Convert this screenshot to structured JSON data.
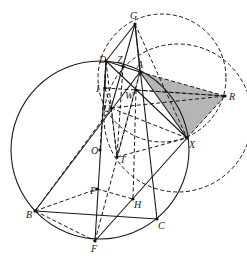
{
  "figure": {
    "type": "geometry-diagram",
    "points": [
      {
        "name": "G",
        "x": 135,
        "y": 24,
        "lx": 130,
        "ly": 19
      },
      {
        "name": "D",
        "x": 106,
        "y": 61,
        "lx": 99,
        "ly": 63
      },
      {
        "name": "Z",
        "x": 123,
        "y": 66,
        "lx": 117,
        "ly": 63
      },
      {
        "name": "A",
        "x": 140,
        "y": 72,
        "lx": 137,
        "ly": 68
      },
      {
        "name": "I",
        "x": 105,
        "y": 88,
        "lx": 96,
        "ly": 92
      },
      {
        "name": "W",
        "x": 136,
        "y": 90,
        "lx": 125,
        "ly": 99
      },
      {
        "name": "R",
        "x": 225,
        "y": 96,
        "lx": 229,
        "ly": 100
      },
      {
        "name": "U",
        "x": 111,
        "y": 108,
        "lx": 103,
        "ly": 112
      },
      {
        "name": "X",
        "x": 187,
        "y": 138,
        "lx": 189,
        "ly": 148
      },
      {
        "name": "O",
        "x": 100,
        "y": 150,
        "lx": 91,
        "ly": 154
      },
      {
        "name": "T",
        "x": 117,
        "y": 157,
        "lx": 120,
        "ly": 163
      },
      {
        "name": "P",
        "x": 97,
        "y": 189,
        "lx": 90,
        "ly": 194
      },
      {
        "name": "H",
        "x": 133,
        "y": 199,
        "lx": 134,
        "ly": 208
      },
      {
        "name": "B",
        "x": 35,
        "y": 211,
        "lx": 26,
        "ly": 218
      },
      {
        "name": "C",
        "x": 157,
        "y": 219,
        "lx": 158,
        "ly": 229
      },
      {
        "name": "F",
        "x": 95,
        "y": 241,
        "lx": 91,
        "ly": 252
      }
    ],
    "circles": [
      {
        "name": "circumcircle",
        "cx": 100,
        "cy": 150,
        "r": 89,
        "style": "solid"
      },
      {
        "name": "dashed-circle-upper",
        "cx": 162,
        "cy": 78,
        "r": 64,
        "style": "dashed"
      },
      {
        "name": "dashed-circle-right",
        "cx": 178,
        "cy": 118,
        "r": 74,
        "style": "dashed"
      }
    ],
    "shaded_triangle": [
      "A",
      "R",
      "X"
    ],
    "solid_segments": [
      [
        "G",
        "D"
      ],
      [
        "G",
        "A"
      ],
      [
        "G",
        "C"
      ],
      [
        "D",
        "X"
      ],
      [
        "D",
        "F"
      ],
      [
        "B",
        "C"
      ],
      [
        "B",
        "A"
      ],
      [
        "F",
        "X"
      ],
      [
        "A",
        "X"
      ],
      [
        "D",
        "A"
      ],
      [
        "G",
        "U"
      ],
      [
        "D",
        "I"
      ]
    ],
    "dashed_segments": [
      [
        "G",
        "X"
      ],
      [
        "D",
        "O"
      ],
      [
        "I",
        "R"
      ],
      [
        "U",
        "R"
      ],
      [
        "A",
        "R"
      ],
      [
        "X",
        "R"
      ],
      [
        "W",
        "R"
      ],
      [
        "B",
        "P"
      ],
      [
        "P",
        "H"
      ],
      [
        "B",
        "F"
      ],
      [
        "F",
        "A"
      ],
      [
        "T",
        "X"
      ],
      [
        "U",
        "T"
      ],
      [
        "D",
        "T"
      ],
      [
        "W",
        "H"
      ],
      [
        "B",
        "U"
      ],
      [
        "Z",
        "T"
      ],
      [
        "A",
        "T"
      ],
      [
        "I",
        "U"
      ],
      [
        "U",
        "X"
      ]
    ]
  }
}
